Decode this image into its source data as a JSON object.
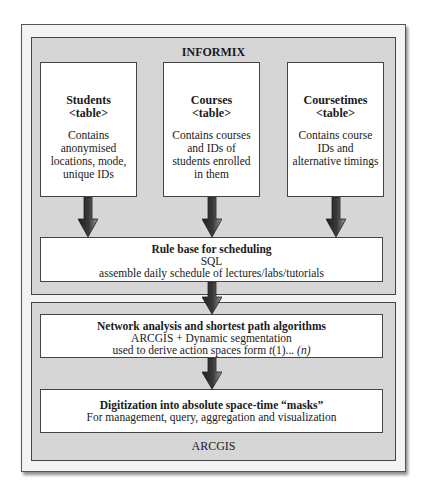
{
  "diagram": {
    "panels": {
      "informix": {
        "label": "INFORMIX"
      },
      "arcgis": {
        "label": "ARCGIS"
      }
    },
    "tables": [
      {
        "title": "Students",
        "subtitle": "<table>",
        "desc": "Contains anonymised locations, mode, unique IDs"
      },
      {
        "title": "Courses",
        "subtitle": "<table>",
        "desc": "Contains courses and IDs of students enrolled in them"
      },
      {
        "title": "Coursetimes",
        "subtitle": "<table>",
        "desc": "Contains course IDs and alternative timings"
      }
    ],
    "rule_base": {
      "title": "Rule base for scheduling",
      "line1": "SQL",
      "line2": "assemble daily schedule of lectures/labs/tutorials"
    },
    "network": {
      "title": "Network analysis and shortest path algorithms",
      "line1": "ARCGIS + Dynamic segmentation",
      "line2_prefix": "used to derive action spaces form ",
      "line2_t": "t",
      "line2_mid": "(1)... ",
      "line2_n": "(n)"
    },
    "digitization": {
      "title": "Digitization into absolute space-time “masks”",
      "line1": "For management, query, aggregation and visualization"
    },
    "colors": {
      "outer_frame": "#f3f3f3",
      "panel_fill": "#d6d6d6",
      "box_fill": "#ffffff",
      "border": "#444444",
      "arrow_dark": "#2a2a2a",
      "arrow_light": "#8a8a8a"
    }
  }
}
